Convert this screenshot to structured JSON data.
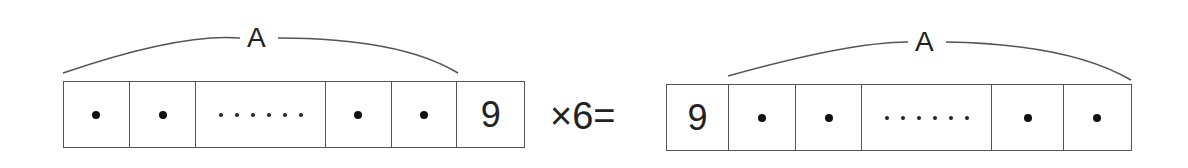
{
  "equation": {
    "left_number": {
      "cells": [
        {
          "type": "dot"
        },
        {
          "type": "dot"
        },
        {
          "type": "dots",
          "count": 6
        },
        {
          "type": "dot"
        },
        {
          "type": "dot"
        },
        {
          "type": "digit",
          "value": "9"
        }
      ],
      "brace_label": "A",
      "brace_spans": "first five cells"
    },
    "operator": "×6=",
    "right_number": {
      "cells": [
        {
          "type": "digit",
          "value": "9"
        },
        {
          "type": "dot"
        },
        {
          "type": "dot"
        },
        {
          "type": "dots",
          "count": 6
        },
        {
          "type": "dot"
        },
        {
          "type": "dot"
        }
      ],
      "brace_label": "A",
      "brace_spans": "last five cells"
    }
  },
  "colors": {
    "line": "#555555",
    "text": "#222222",
    "background": "#ffffff"
  }
}
